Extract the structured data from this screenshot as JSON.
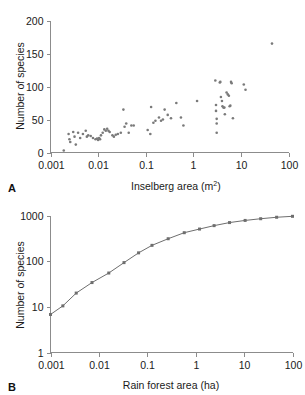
{
  "figure": {
    "panel_a_letter": "A",
    "panel_b_letter": "B"
  },
  "chart_data": [
    {
      "id": "panel-a",
      "type": "scatter",
      "title": "",
      "xlabel": "Inselberg area (m2)",
      "xlabel_base": "Inselberg area (m",
      "xlabel_sup": "2",
      "xlabel_tail": ")",
      "ylabel": "Number of species",
      "xscale": "log",
      "yscale": "linear",
      "xlim": [
        0.001,
        100
      ],
      "ylim": [
        0,
        200
      ],
      "xticks": [
        0.001,
        0.01,
        0.1,
        1,
        10,
        100
      ],
      "xtick_labels": [
        "0.001",
        "0.01",
        "0.1",
        "1",
        "10",
        "100"
      ],
      "yticks": [
        0,
        50,
        100,
        150,
        200
      ],
      "ytick_labels": [
        "0",
        "50",
        "100",
        "150",
        "200"
      ],
      "grid": false,
      "legend": "none",
      "marker_color": "#7a7a7a",
      "points": [
        [
          0.0019,
          3
        ],
        [
          0.0024,
          28
        ],
        [
          0.0025,
          20
        ],
        [
          0.0026,
          16
        ],
        [
          0.003,
          31
        ],
        [
          0.0032,
          24
        ],
        [
          0.0034,
          12
        ],
        [
          0.0038,
          30
        ],
        [
          0.0042,
          22
        ],
        [
          0.0048,
          28
        ],
        [
          0.0055,
          33
        ],
        [
          0.0058,
          24
        ],
        [
          0.0062,
          26
        ],
        [
          0.007,
          25
        ],
        [
          0.0078,
          22
        ],
        [
          0.0088,
          20
        ],
        [
          0.0095,
          21
        ],
        [
          0.01,
          19
        ],
        [
          0.0105,
          22
        ],
        [
          0.011,
          20
        ],
        [
          0.0115,
          26
        ],
        [
          0.0125,
          30
        ],
        [
          0.0135,
          35
        ],
        [
          0.0145,
          33
        ],
        [
          0.0155,
          36
        ],
        [
          0.0165,
          33
        ],
        [
          0.0175,
          31
        ],
        [
          0.02,
          26
        ],
        [
          0.0215,
          24
        ],
        [
          0.0235,
          27
        ],
        [
          0.026,
          28
        ],
        [
          0.03,
          30
        ],
        [
          0.034,
          65
        ],
        [
          0.036,
          39
        ],
        [
          0.039,
          44
        ],
        [
          0.044,
          30
        ],
        [
          0.05,
          41
        ],
        [
          0.056,
          41
        ],
        [
          0.11,
          34
        ],
        [
          0.125,
          28
        ],
        [
          0.13,
          69
        ],
        [
          0.145,
          45
        ],
        [
          0.16,
          48
        ],
        [
          0.19,
          53
        ],
        [
          0.21,
          48
        ],
        [
          0.23,
          50
        ],
        [
          0.25,
          65
        ],
        [
          0.29,
          57
        ],
        [
          0.34,
          52
        ],
        [
          0.44,
          75
        ],
        [
          0.55,
          53
        ],
        [
          0.62,
          41
        ],
        [
          1.2,
          78
        ],
        [
          2.9,
          109
        ],
        [
          3.0,
          72
        ],
        [
          3.0,
          63
        ],
        [
          3.1,
          51
        ],
        [
          3.1,
          44
        ],
        [
          3.1,
          30
        ],
        [
          3.6,
          106
        ],
        [
          3.7,
          107
        ],
        [
          3.8,
          84
        ],
        [
          4.0,
          78
        ],
        [
          4.1,
          70
        ],
        [
          4.3,
          68
        ],
        [
          4.5,
          68
        ],
        [
          4.6,
          58
        ],
        [
          5.0,
          91
        ],
        [
          5.3,
          88
        ],
        [
          5.6,
          86
        ],
        [
          5.8,
          70
        ],
        [
          6.0,
          71
        ],
        [
          6.2,
          107
        ],
        [
          6.4,
          105
        ],
        [
          6.8,
          52
        ],
        [
          11.5,
          103
        ],
        [
          12.5,
          95
        ],
        [
          45.0,
          165
        ]
      ]
    },
    {
      "id": "panel-b",
      "type": "line",
      "title": "",
      "xlabel": "Rain forest area (ha)",
      "ylabel": "Number of species",
      "xscale": "log",
      "yscale": "log",
      "xlim": [
        0.001,
        100
      ],
      "ylim": [
        1,
        1000
      ],
      "xticks": [
        0.001,
        0.01,
        0.1,
        1,
        10,
        100
      ],
      "xtick_labels": [
        "0.001",
        "0.01",
        "0.1",
        "1",
        "10",
        "100"
      ],
      "yticks": [
        1,
        10,
        100,
        1000
      ],
      "ytick_labels": [
        "1",
        "10",
        "100",
        "1000"
      ],
      "grid": false,
      "legend": "none",
      "line_color": "#6e6e6e",
      "marker_color": "#6e6e6e",
      "series": [
        {
          "name": "species accumulation",
          "points": [
            [
              0.001,
              6.8
            ],
            [
              0.0018,
              10.5
            ],
            [
              0.0034,
              20
            ],
            [
              0.0072,
              34
            ],
            [
              0.016,
              55
            ],
            [
              0.033,
              93
            ],
            [
              0.066,
              152
            ],
            [
              0.125,
              222
            ],
            [
              0.27,
              310
            ],
            [
              0.58,
              420
            ],
            [
              1.2,
              505
            ],
            [
              2.4,
              600
            ],
            [
              5.0,
              700
            ],
            [
              10.5,
              780
            ],
            [
              22.0,
              850
            ],
            [
              47.0,
              915
            ],
            [
              100.0,
              960
            ]
          ]
        }
      ]
    }
  ]
}
